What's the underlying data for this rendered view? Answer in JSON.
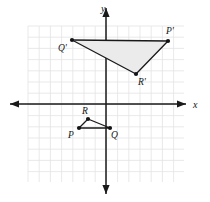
{
  "figure": {
    "background_color": "#ffffff",
    "grid": {
      "color": "#e3e3e3",
      "spacing_px": 11.2,
      "left_px": 28,
      "top_px": 26,
      "right_px": 184,
      "bottom_px": 182,
      "visible": true
    },
    "axes": {
      "color": "#1a1a1a",
      "origin_px": {
        "x": 106,
        "y": 104
      },
      "x_axis": {
        "label": "x",
        "label_pos_px": {
          "x": 193,
          "y": 100
        },
        "start_px": 10,
        "end_px": 186,
        "arrows": "both"
      },
      "y_axis": {
        "label": "y",
        "label_pos_px": {
          "x": 101,
          "y": 4
        },
        "start_px": 8,
        "end_px": 194,
        "arrows": "both"
      }
    },
    "shapes": [
      {
        "name": "triangle-pqr",
        "kind": "triangle",
        "fill": "none",
        "stroke": "#1a1a1a",
        "stroke_width": 1.3,
        "vertices": [
          {
            "label": "P",
            "px": {
              "x": 79,
              "y": 128
            },
            "graph": {
              "x": -2.4,
              "y": -2.1
            },
            "label_pos_px": {
              "x": 68,
              "y": 131
            }
          },
          {
            "label": "Q",
            "px": {
              "x": 110,
              "y": 128
            },
            "graph": {
              "x": 0.4,
              "y": -2.1
            },
            "label_pos_px": {
              "x": 111,
              "y": 131
            }
          },
          {
            "label": "R",
            "px": {
              "x": 88,
              "y": 119
            },
            "graph": {
              "x": -1.6,
              "y": -1.3
            },
            "label_pos_px": {
              "x": 82,
              "y": 107
            }
          }
        ]
      },
      {
        "name": "triangle-p-prime-q-prime-r-prime",
        "kind": "triangle",
        "fill": "#ebebeb",
        "stroke": "#1a1a1a",
        "stroke_width": 1.3,
        "vertices": [
          {
            "label": "P'",
            "px": {
              "x": 168,
              "y": 41
            },
            "graph": {
              "x": 5.5,
              "y": 5.6
            },
            "label_pos_px": {
              "x": 166,
              "y": 27
            }
          },
          {
            "label": "Q'",
            "px": {
              "x": 72,
              "y": 40
            },
            "graph": {
              "x": -3.0,
              "y": 5.7
            },
            "label_pos_px": {
              "x": 58,
              "y": 44
            }
          },
          {
            "label": "R'",
            "px": {
              "x": 136,
              "y": 74
            },
            "graph": {
              "x": 2.7,
              "y": 2.7
            },
            "label_pos_px": {
              "x": 138,
              "y": 78
            }
          }
        ]
      }
    ],
    "vertex_dot": {
      "radius_px": 2.1,
      "color": "#141414"
    }
  },
  "chart_data": {
    "type": "scatter",
    "xlabel": "x",
    "ylabel": "y",
    "xlim": [
      -7,
      7
    ],
    "ylim": [
      -7,
      7
    ],
    "grid": true,
    "legend": "none",
    "series": [
      {
        "name": "Triangle PQR",
        "points": [
          {
            "label": "P",
            "x": -2.4,
            "y": -2.1
          },
          {
            "label": "Q",
            "x": 0.4,
            "y": -2.1
          },
          {
            "label": "R",
            "x": -1.6,
            "y": -1.3
          }
        ]
      },
      {
        "name": "Triangle P'Q'R'",
        "points": [
          {
            "label": "P'",
            "x": 5.5,
            "y": 5.6
          },
          {
            "label": "Q'",
            "x": -3.0,
            "y": 5.7
          },
          {
            "label": "R'",
            "x": 2.7,
            "y": 2.7
          }
        ]
      }
    ]
  }
}
